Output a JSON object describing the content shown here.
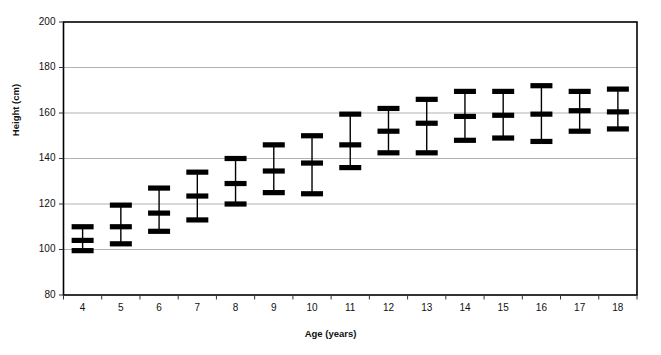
{
  "chart_data": {
    "type": "line",
    "title": "",
    "xlabel": "Age (years)",
    "ylabel": "Height (cm)",
    "xlim": [
      3.4,
      18.6
    ],
    "ylim": [
      80,
      200
    ],
    "yticks": [
      80,
      100,
      120,
      140,
      160,
      180,
      200
    ],
    "grid": "horizontal",
    "legend": "none",
    "marker_style": "horizontal-bar",
    "categories": [
      "4",
      "5",
      "6",
      "7",
      "8",
      "9",
      "10",
      "11",
      "12",
      "13",
      "14",
      "15",
      "16",
      "17",
      "18"
    ],
    "series": [
      {
        "name": "Upper",
        "values": [
          110,
          119.5,
          127,
          134,
          140,
          146,
          150,
          159.5,
          162,
          166,
          169.5,
          169.5,
          172,
          169.5,
          170.5
        ]
      },
      {
        "name": "Median",
        "values": [
          104,
          110,
          116,
          123.5,
          129,
          134.5,
          138,
          146,
          152,
          155.5,
          158.5,
          159,
          159.5,
          161,
          160.5
        ]
      },
      {
        "name": "Lower",
        "values": [
          99.5,
          102.5,
          108,
          113,
          120,
          125,
          124.5,
          136,
          142.5,
          142.5,
          148,
          149,
          147.5,
          152,
          153
        ]
      }
    ],
    "points": [
      {
        "age": "4",
        "upper": 110,
        "median": 104,
        "lower": 99.5
      },
      {
        "age": "5",
        "upper": 119.5,
        "median": 110,
        "lower": 102.5
      },
      {
        "age": "6",
        "upper": 127,
        "median": 116,
        "lower": 108
      },
      {
        "age": "7",
        "upper": 134,
        "median": 123.5,
        "lower": 113
      },
      {
        "age": "8",
        "upper": 140,
        "median": 129,
        "lower": 120
      },
      {
        "age": "9",
        "upper": 146,
        "median": 134.5,
        "lower": 125
      },
      {
        "age": "10",
        "upper": 150,
        "median": 138,
        "lower": 124.5
      },
      {
        "age": "11",
        "upper": 159.5,
        "median": 146,
        "lower": 136
      },
      {
        "age": "12",
        "upper": 162,
        "median": 152,
        "lower": 142.5
      },
      {
        "age": "13",
        "upper": 166,
        "median": 155.5,
        "lower": 142.5
      },
      {
        "age": "14",
        "upper": 169.5,
        "median": 158.5,
        "lower": 148
      },
      {
        "age": "15",
        "upper": 169.5,
        "median": 159,
        "lower": 149
      },
      {
        "age": "16",
        "upper": 172,
        "median": 159.5,
        "lower": 147.5
      },
      {
        "age": "17",
        "upper": 169.5,
        "median": 161,
        "lower": 152
      },
      {
        "age": "18",
        "upper": 170.5,
        "median": 160.5,
        "lower": 153
      }
    ]
  },
  "colors": {
    "marker": "#000000",
    "frame": "#000000",
    "grid": "#a8a8a8",
    "background": "#ffffff",
    "text": "#111111"
  }
}
